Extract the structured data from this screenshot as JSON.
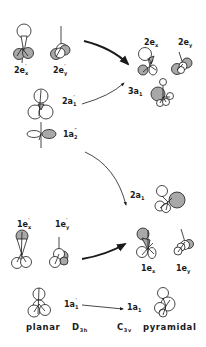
{
  "diagram": {
    "colors": {
      "ink": "#1a1a1a",
      "shaded_lobe": "#a8a8a8",
      "background": "#ffffff"
    },
    "left_column": {
      "geometry": "planar",
      "point_group": "D",
      "point_group_sub": "3h",
      "orbitals": [
        {
          "id": "2ex_prime",
          "label": "2e",
          "sub": "x",
          "sup": "′"
        },
        {
          "id": "2ey_prime",
          "label": "2e",
          "sub": "y",
          "sup": "′"
        },
        {
          "id": "2a1_prime",
          "label": "2a",
          "sub": "1",
          "sup": "′"
        },
        {
          "id": "1a2_dprime",
          "label": "1a",
          "sub": "2",
          "sup": "″"
        },
        {
          "id": "1ex_prime",
          "label": "1e",
          "sub": "x",
          "sup": "′"
        },
        {
          "id": "1ey_prime",
          "label": "1e",
          "sub": "y",
          "sup": "′"
        },
        {
          "id": "1a1_prime",
          "label": "1a",
          "sub": "1",
          "sup": "′"
        }
      ]
    },
    "right_column": {
      "geometry": "pyramidal",
      "point_group": "C",
      "point_group_sub": "3v",
      "orbitals": [
        {
          "id": "2ex",
          "label": "2e",
          "sub": "x"
        },
        {
          "id": "2ey",
          "label": "2e",
          "sub": "y"
        },
        {
          "id": "3a1",
          "label": "3a",
          "sub": "1"
        },
        {
          "id": "2a1",
          "label": "2a",
          "sub": "1"
        },
        {
          "id": "1ex",
          "label": "1e",
          "sub": "x"
        },
        {
          "id": "1ey",
          "label": "1e",
          "sub": "y"
        },
        {
          "id": "1a1",
          "label": "1a",
          "sub": "1"
        }
      ]
    },
    "correlations": [
      {
        "from": "2e′",
        "to": "2e",
        "style": "thick"
      },
      {
        "from": "2a1′",
        "to": "3a1",
        "style": "thin"
      },
      {
        "from": "1a2″",
        "to": "2a1",
        "style": "thin"
      },
      {
        "from": "1e′",
        "to": "1e",
        "style": "thick"
      },
      {
        "from": "1a1′",
        "to": "1a1",
        "style": "thin"
      }
    ]
  }
}
